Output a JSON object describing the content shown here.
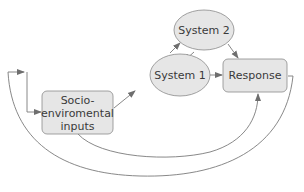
{
  "diagram": {
    "nodes": {
      "system2": {
        "label": "System 2",
        "shape": "ellipse"
      },
      "system1": {
        "label": "System 1",
        "shape": "ellipse"
      },
      "response": {
        "label": "Response",
        "shape": "rounded-rect"
      },
      "socio": {
        "label_lines": [
          "Socio-",
          "enviromental",
          "inputs"
        ],
        "shape": "rounded-rect"
      }
    },
    "edges": [
      {
        "from": "socio",
        "to": "system1"
      },
      {
        "from": "system1",
        "to": "system2"
      },
      {
        "from": "system2",
        "to": "system1"
      },
      {
        "from": "system1",
        "to": "response"
      },
      {
        "from": "system2",
        "to": "response"
      },
      {
        "from": "socio",
        "to": "response"
      },
      {
        "from": "response",
        "to": "socio",
        "via": "outer-loop"
      }
    ],
    "colors": {
      "node_fill": "#e6e6e6",
      "node_stroke": "#8a8a8a",
      "edge": "#6e6e6e",
      "text": "#3a3a3a"
    }
  }
}
